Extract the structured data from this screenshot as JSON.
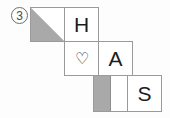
{
  "item": {
    "number_label": "③",
    "number_plain": "3"
  },
  "diagram": {
    "type": "cube-net",
    "background_color": "#fdfdfd",
    "line_color": "#9a9a9a",
    "fill_color": "#a9a9a9",
    "text_color": "#1d1d1d",
    "cell_size": 34,
    "cells": [
      {
        "id": "cell-triangle",
        "name": "triangle-cell",
        "row": 0,
        "col": 0,
        "x": 30,
        "y": 7,
        "label": "",
        "fill": "triangle-upper-left",
        "fill_color": "#a9a9a9"
      },
      {
        "id": "cell-h",
        "name": "letter-h-cell",
        "row": 0,
        "col": 1,
        "x": 64,
        "y": 7,
        "label": "H",
        "fill": "none"
      },
      {
        "id": "cell-heart",
        "name": "heart-cell",
        "row": 1,
        "col": 1,
        "x": 64,
        "y": 41,
        "label": "♡",
        "fill": "none"
      },
      {
        "id": "cell-a",
        "name": "letter-a-cell",
        "row": 1,
        "col": 2,
        "x": 94,
        "y": 41,
        "label": "A",
        "fill": "none"
      },
      {
        "id": "cell-bar",
        "name": "half-bar-cell",
        "row": 2,
        "col": 2,
        "x": 94,
        "y": 75,
        "label": "",
        "fill": "left-half-bar",
        "fill_color": "#a9a9a9"
      },
      {
        "id": "cell-s",
        "name": "letter-s-cell",
        "row": 2,
        "col": 3,
        "x": 124,
        "y": 75,
        "label": "S",
        "fill": "none"
      }
    ]
  }
}
